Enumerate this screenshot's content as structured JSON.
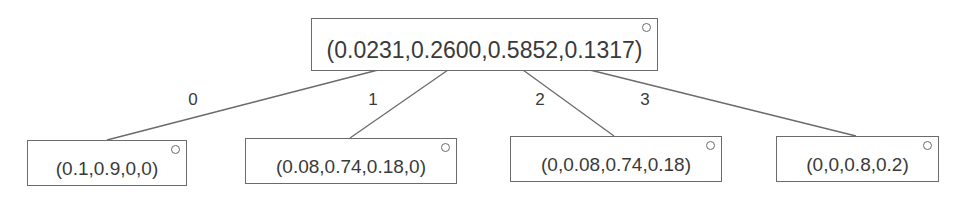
{
  "tree": {
    "root": {
      "label": "(0.0231,0.2600,0.5852,0.1317)",
      "box": {
        "x": 311,
        "y": 18,
        "w": 347,
        "h": 53
      }
    },
    "children": [
      {
        "edge_label": "0",
        "label": "(0.1,0.9,0,0)",
        "box": {
          "x": 27,
          "y": 140,
          "w": 160,
          "h": 46
        },
        "edge": {
          "x1": 378,
          "y1": 70,
          "x2": 107,
          "y2": 140
        },
        "label_pos": {
          "x": 193,
          "y": 100
        }
      },
      {
        "edge_label": "1",
        "label": "(0.08,0.74,0.18,0)",
        "box": {
          "x": 245,
          "y": 138,
          "w": 212,
          "h": 46
        },
        "edge": {
          "x1": 448,
          "y1": 70,
          "x2": 350,
          "y2": 138
        },
        "label_pos": {
          "x": 373,
          "y": 100
        }
      },
      {
        "edge_label": "2",
        "label": "(0,0.08,0.74,0.18)",
        "box": {
          "x": 510,
          "y": 136,
          "w": 212,
          "h": 46
        },
        "edge": {
          "x1": 523,
          "y1": 70,
          "x2": 614,
          "y2": 136
        },
        "label_pos": {
          "x": 540,
          "y": 100
        }
      },
      {
        "edge_label": "3",
        "label": "(0,0,0.8,0.2)",
        "box": {
          "x": 776,
          "y": 136,
          "w": 163,
          "h": 46
        },
        "edge": {
          "x1": 590,
          "y1": 70,
          "x2": 856,
          "y2": 136
        },
        "label_pos": {
          "x": 645,
          "y": 100
        }
      }
    ]
  },
  "colors": {
    "line": "#6b6b6b",
    "text": "#3a3a3a",
    "background": "#ffffff"
  }
}
